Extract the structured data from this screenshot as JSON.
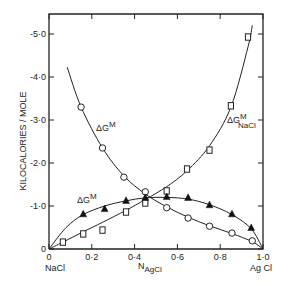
{
  "chart_data": {
    "type": "line",
    "title": "",
    "xlabel": "N_AgCl",
    "ylabel": "KILOCALORIES / MOLE",
    "xlim": [
      0,
      1.0
    ],
    "ylim": [
      0,
      -5.0
    ],
    "grid": false,
    "legend": "inline labels",
    "x_ticks": [
      "0",
      "0·2",
      "0·4",
      "0·6",
      "0·8",
      "1·0"
    ],
    "y_ticks": [
      "0",
      "-1·0",
      "-2·0",
      "-3·0",
      "-4·0",
      "-5·0"
    ],
    "x_end_labels": {
      "left": "NaCl",
      "right": "Ag Cl"
    },
    "series": [
      {
        "name": "ΔG^M (open circles, partial AgCl)",
        "label_main": "ΔG",
        "label_sup": "M",
        "marker": "circle-open",
        "x": [
          0.15,
          0.25,
          0.35,
          0.45,
          0.55,
          0.65,
          0.75,
          0.855,
          0.95
        ],
        "y": [
          -3.3,
          -2.35,
          -1.67,
          -1.33,
          -0.96,
          -0.72,
          -0.53,
          -0.37,
          -0.19
        ],
        "curve": [
          [
            0.085,
            -4.23
          ],
          [
            0.15,
            -3.3
          ],
          [
            0.25,
            -2.35
          ],
          [
            0.35,
            -1.7
          ],
          [
            0.45,
            -1.28
          ],
          [
            0.55,
            -0.98
          ],
          [
            0.65,
            -0.74
          ],
          [
            0.75,
            -0.54
          ],
          [
            0.855,
            -0.36
          ],
          [
            0.95,
            -0.17
          ],
          [
            1.0,
            0
          ]
        ]
      },
      {
        "name": "ΔG^M_NaCl (open squares)",
        "label_main": "ΔG",
        "label_sup": "M",
        "label_sub": "NaCl",
        "marker": "square-open",
        "x": [
          0.065,
          0.16,
          0.25,
          0.36,
          0.45,
          0.55,
          0.645,
          0.75,
          0.85,
          0.93
        ],
        "y": [
          -0.16,
          -0.35,
          -0.44,
          -0.86,
          -1.07,
          -1.35,
          -1.86,
          -2.3,
          -3.33,
          -4.93
        ],
        "curve": [
          [
            0,
            0
          ],
          [
            0.065,
            -0.16
          ],
          [
            0.16,
            -0.4
          ],
          [
            0.25,
            -0.62
          ],
          [
            0.36,
            -0.9
          ],
          [
            0.45,
            -1.15
          ],
          [
            0.55,
            -1.45
          ],
          [
            0.645,
            -1.82
          ],
          [
            0.75,
            -2.4
          ],
          [
            0.85,
            -3.3
          ],
          [
            0.93,
            -4.7
          ],
          [
            0.95,
            -5.2
          ]
        ]
      },
      {
        "name": "ΔG^M (filled triangles, integral)",
        "label_main": "ΔG",
        "label_sup": "M",
        "marker": "triangle-filled",
        "x": [
          0.16,
          0.26,
          0.36,
          0.45,
          0.55,
          0.65,
          0.75,
          0.855,
          0.945
        ],
        "y": [
          -0.81,
          -0.93,
          -1.12,
          -1.19,
          -1.21,
          -1.19,
          -1.02,
          -0.81,
          -0.49
        ],
        "curve": [
          [
            0,
            0
          ],
          [
            0.08,
            -0.5
          ],
          [
            0.16,
            -0.8
          ],
          [
            0.26,
            -1.0
          ],
          [
            0.36,
            -1.12
          ],
          [
            0.45,
            -1.19
          ],
          [
            0.55,
            -1.2
          ],
          [
            0.65,
            -1.16
          ],
          [
            0.75,
            -1.03
          ],
          [
            0.855,
            -0.8
          ],
          [
            0.945,
            -0.47
          ],
          [
            1.0,
            0
          ]
        ]
      }
    ]
  },
  "labels": {
    "ylabel": "KILOCALORIES / MOLE",
    "xlabel_main": "N",
    "xlabel_sub": "AgCl",
    "x_left": "NaCl",
    "x_right": "Ag Cl",
    "series_circle_main": "ΔG",
    "series_circle_sup": "M",
    "series_square_main": "ΔG",
    "series_square_sup": "M",
    "series_square_sub": "NaCl",
    "series_triangle_main": "ΔG",
    "series_triangle_sup": "M"
  }
}
